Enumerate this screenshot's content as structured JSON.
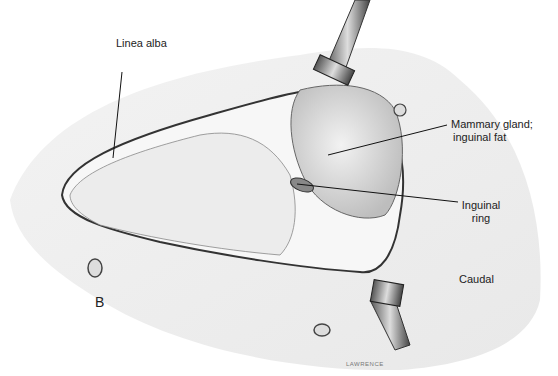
{
  "figure": {
    "panel_letter": "B",
    "labels": {
      "linea_alba": "Linea alba",
      "mammary_line1": "Mammary gland;",
      "mammary_line2": "inguinal fat",
      "inguinal_line1": "Inguinal",
      "inguinal_line2": "ring",
      "caudal": "Caudal"
    },
    "signature": "LAWRENCE"
  }
}
